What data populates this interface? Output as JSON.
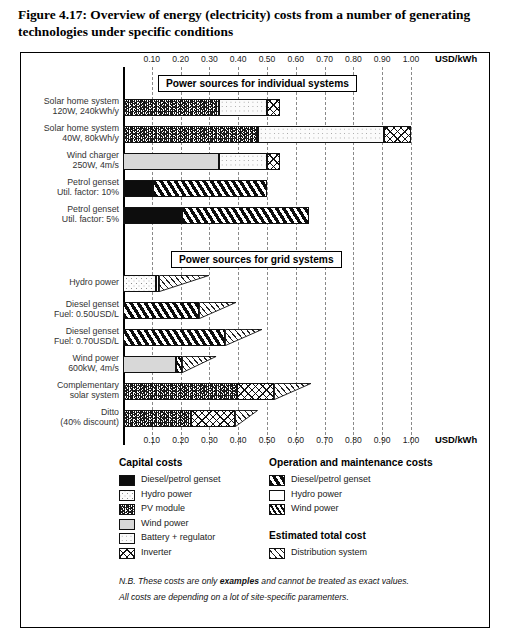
{
  "figure": {
    "caption": "Figure 4.17:  Overview of energy (electricity) costs from a number of generating technologies under specific conditions"
  },
  "axis": {
    "unit_label": "USD/kWh",
    "ticks": [
      "0.10",
      "0.20",
      "0.30",
      "0.40",
      "0.50",
      "0.60",
      "0.70",
      "0.80",
      "0.90",
      "1.00"
    ],
    "min": 0.0,
    "max": 1.06
  },
  "sections": {
    "individual": "Power sources for individual systems",
    "grid": "Power sources for grid systems"
  },
  "legend": {
    "capital_title": "Capital costs",
    "capital_items": [
      {
        "label": "Diesel/petrol genset",
        "pattern": "p-black"
      },
      {
        "label": "Hydro power",
        "pattern": "p-hydro"
      },
      {
        "label": "PV module",
        "pattern": "p-pv"
      },
      {
        "label": "Wind power",
        "pattern": "p-wind"
      },
      {
        "label": "Battery + regulator",
        "pattern": "p-batt"
      },
      {
        "label": "Inverter",
        "pattern": "p-inv"
      }
    ],
    "om_title": "Operation and maintenance costs",
    "om_items": [
      {
        "label": "Diesel/petrol genset",
        "pattern": "p-omdiesel"
      },
      {
        "label": "Hydro power",
        "pattern": "p-omhydro"
      },
      {
        "label": "Wind power",
        "pattern": "p-omwind"
      }
    ],
    "total_title": "Estimated total cost",
    "total_items": [
      {
        "label": "Distribution system",
        "pattern": "p-dist"
      }
    ]
  },
  "notes": {
    "line1_pre": "N.B. These costs are only ",
    "line1_bold": "examples",
    "line1_post": " and cannot be treated as exact values.",
    "line2": "All costs are depending on a lot of site-specific paramenters."
  },
  "chart_data": {
    "type": "bar",
    "title": "Overview of energy (electricity) costs from a number of generating technologies under specific conditions",
    "xlabel": "USD/kWh",
    "ylabel": "",
    "xlim": [
      0.0,
      1.06
    ],
    "grid": true,
    "orientation": "horizontal",
    "stacked": true,
    "legend_position": "bottom",
    "tick_values": [
      0.1,
      0.2,
      0.3,
      0.4,
      0.5,
      0.6,
      0.7,
      0.8,
      0.9,
      1.0
    ],
    "groups": [
      {
        "name": "Power sources for individual systems",
        "rows": [
          {
            "label_line1": "Solar home system",
            "label_line2": "120W, 240kWh/y",
            "total": 0.545,
            "segments": [
              {
                "name": "PV module",
                "pattern": "p-pv",
                "start": 0.0,
                "end": 0.335,
                "shape": "bar"
              },
              {
                "name": "Battery + regulator",
                "pattern": "p-batt",
                "start": 0.335,
                "end": 0.5,
                "shape": "bar"
              },
              {
                "name": "Inverter",
                "pattern": "p-inv",
                "start": 0.5,
                "end": 0.545,
                "shape": "bar"
              }
            ]
          },
          {
            "label_line1": "Solar home system",
            "label_line2": "40W, 80kWh/y",
            "total": 1.0,
            "segments": [
              {
                "name": "PV module",
                "pattern": "p-pv",
                "start": 0.0,
                "end": 0.47,
                "shape": "bar"
              },
              {
                "name": "Battery + regulator",
                "pattern": "p-batt",
                "start": 0.47,
                "end": 0.905,
                "shape": "bar"
              },
              {
                "name": "Inverter",
                "pattern": "p-inv",
                "start": 0.905,
                "end": 1.0,
                "shape": "bar"
              }
            ]
          },
          {
            "label_line1": "Wind charger",
            "label_line2": "250W, 4m/s",
            "total": 0.545,
            "segments": [
              {
                "name": "Wind power",
                "pattern": "p-wind",
                "start": 0.0,
                "end": 0.335,
                "shape": "bar"
              },
              {
                "name": "Battery + regulator",
                "pattern": "p-batt",
                "start": 0.335,
                "end": 0.5,
                "shape": "bar"
              },
              {
                "name": "Inverter",
                "pattern": "p-inv",
                "start": 0.5,
                "end": 0.545,
                "shape": "bar"
              }
            ]
          },
          {
            "label_line1": "Petrol genset",
            "label_line2": "Util. factor: 10%",
            "total": 0.5,
            "segments": [
              {
                "name": "Diesel/petrol genset",
                "pattern": "p-black",
                "start": 0.0,
                "end": 0.105,
                "shape": "bar"
              },
              {
                "name": "O&M Diesel/petrol genset",
                "pattern": "p-omdiesel",
                "start": 0.105,
                "end": 0.5,
                "shape": "bar"
              }
            ]
          },
          {
            "label_line1": "Petrol genset",
            "label_line2": "Util. factor: 5%",
            "total": 0.645,
            "segments": [
              {
                "name": "Diesel/petrol genset",
                "pattern": "p-black",
                "start": 0.0,
                "end": 0.205,
                "shape": "bar"
              },
              {
                "name": "O&M Diesel/petrol genset",
                "pattern": "p-omdiesel",
                "start": 0.205,
                "end": 0.645,
                "shape": "bar"
              }
            ]
          }
        ]
      },
      {
        "name": "Power sources for grid systems",
        "rows": [
          {
            "label_line1": "Hydro power",
            "label_line2": "",
            "total": 0.3,
            "segments": [
              {
                "name": "Hydro power",
                "pattern": "p-hydro",
                "start": 0.0,
                "end": 0.115,
                "shape": "bar"
              },
              {
                "name": "O&M Hydro power",
                "pattern": "p-omhydro",
                "start": 0.115,
                "end": 0.125,
                "shape": "bar"
              },
              {
                "name": "Distribution system",
                "pattern": "p-dist",
                "start": 0.125,
                "end": 0.3,
                "shape": "wedge"
              }
            ]
          },
          {
            "label_line1": "Diesel genset",
            "label_line2": "Fuel: 0.50USD/L",
            "total": 0.395,
            "segments": [
              {
                "name": "O&M Diesel/petrol genset",
                "pattern": "p-omdiesel",
                "start": 0.0,
                "end": 0.265,
                "shape": "bar"
              },
              {
                "name": "Distribution system",
                "pattern": "p-dist",
                "start": 0.265,
                "end": 0.395,
                "shape": "wedge"
              }
            ]
          },
          {
            "label_line1": "Diesel genset",
            "label_line2": "Fuel: 0.70USD/L",
            "total": 0.485,
            "segments": [
              {
                "name": "O&M Diesel/petrol genset",
                "pattern": "p-omdiesel",
                "start": 0.0,
                "end": 0.355,
                "shape": "bar"
              },
              {
                "name": "Distribution system",
                "pattern": "p-dist",
                "start": 0.355,
                "end": 0.485,
                "shape": "wedge"
              }
            ]
          },
          {
            "label_line1": "Wind power",
            "label_line2": "600kW, 4m/s",
            "total": 0.325,
            "segments": [
              {
                "name": "Wind power",
                "pattern": "p-wind",
                "start": 0.0,
                "end": 0.185,
                "shape": "bar"
              },
              {
                "name": "O&M Wind power",
                "pattern": "p-omwind",
                "start": 0.185,
                "end": 0.205,
                "shape": "bar"
              },
              {
                "name": "Distribution system",
                "pattern": "p-dist",
                "start": 0.205,
                "end": 0.325,
                "shape": "wedge"
              }
            ]
          },
          {
            "label_line1": "Complementary",
            "label_line2": "solar system",
            "total": 0.655,
            "segments": [
              {
                "name": "PV module",
                "pattern": "p-pv",
                "start": 0.0,
                "end": 0.395,
                "shape": "bar"
              },
              {
                "name": "Inverter",
                "pattern": "p-inv",
                "start": 0.395,
                "end": 0.525,
                "shape": "bar"
              },
              {
                "name": "Distribution system",
                "pattern": "p-dist",
                "start": 0.525,
                "end": 0.655,
                "shape": "wedge"
              }
            ]
          },
          {
            "label_line1": "Ditto",
            "label_line2": "(40% discount)",
            "total": 0.47,
            "segments": [
              {
                "name": "PV module",
                "pattern": "p-pv",
                "start": 0.0,
                "end": 0.235,
                "shape": "bar"
              },
              {
                "name": "Inverter",
                "pattern": "p-inv",
                "start": 0.235,
                "end": 0.39,
                "shape": "bar"
              },
              {
                "name": "Distribution system",
                "pattern": "p-dist",
                "start": 0.39,
                "end": 0.47,
                "shape": "wedge"
              }
            ]
          }
        ]
      }
    ]
  }
}
